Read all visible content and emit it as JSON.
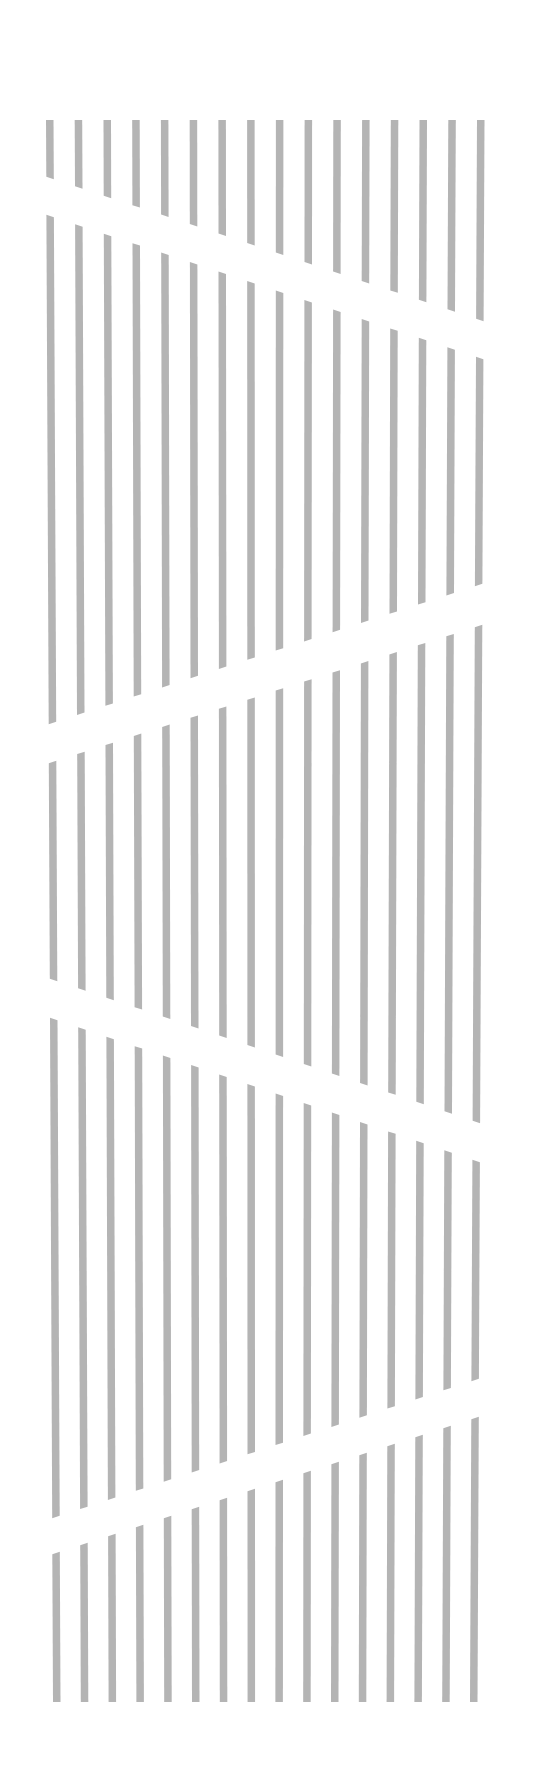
{
  "canvas": {
    "width": 542,
    "height": 1790,
    "background": "#ffffff"
  },
  "stripes": {
    "count": 16,
    "color": "#b4b4b4",
    "bar_width": 7.5,
    "first_x_top": 46,
    "last_x_top": 477,
    "first_x_bottom": 53,
    "last_x_bottom": 470,
    "top_y": 120,
    "bottom_y": 1702
  },
  "gaps": [
    {
      "left_top": 178,
      "left_bottom": 216,
      "right_top": 320,
      "right_bottom": 358
    },
    {
      "left_top": 723,
      "left_bottom": 762,
      "right_top": 585,
      "right_bottom": 626
    },
    {
      "left_top": 980,
      "left_bottom": 1019,
      "right_top": 1122,
      "right_bottom": 1161
    },
    {
      "left_top": 1517,
      "left_bottom": 1553,
      "right_top": 1380,
      "right_bottom": 1418
    }
  ]
}
